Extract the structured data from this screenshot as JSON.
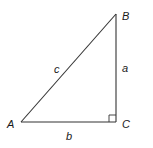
{
  "diagram": {
    "type": "right-triangle",
    "right_angle_at": "C",
    "vertices": {
      "A": {
        "label": "A",
        "x": 21,
        "y": 122
      },
      "B": {
        "label": "B",
        "x": 116,
        "y": 14
      },
      "C": {
        "label": "C",
        "x": 116,
        "y": 122
      }
    },
    "sides": {
      "a": {
        "label": "a",
        "between": [
          "B",
          "C"
        ]
      },
      "b": {
        "label": "b",
        "between": [
          "A",
          "C"
        ]
      },
      "c": {
        "label": "c",
        "between": [
          "A",
          "B"
        ],
        "role": "hypotenuse"
      }
    },
    "colors": {
      "stroke": "#333333",
      "text": "#1a1a1a",
      "background": "#ffffff"
    }
  }
}
